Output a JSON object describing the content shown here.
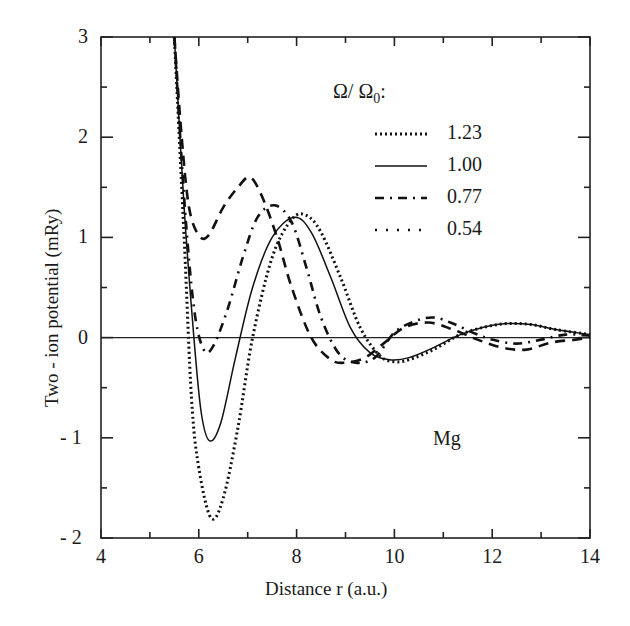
{
  "chart_data": {
    "type": "line",
    "title": "",
    "xlabel": "Distance r (a.u.)",
    "ylabel": "Two - ion potential (mRy)",
    "xlim": [
      4,
      14
    ],
    "ylim": [
      -2,
      3
    ],
    "xticks": [
      "4",
      "6",
      "8",
      "10",
      "12",
      "14"
    ],
    "yticks": [
      "- 2",
      "- 1",
      "0",
      "1",
      "2",
      "3"
    ],
    "grid": false,
    "legend_title": "Ω/ Ω0:",
    "legend_position": "upper right",
    "annotation": "Mg",
    "series": [
      {
        "name": "1.23",
        "style": "dotted-dense",
        "x": [
          5.5,
          5.7,
          5.85,
          6.0,
          6.25,
          6.5,
          6.8,
          7.1,
          7.5,
          7.9,
          8.2,
          8.5,
          8.9,
          9.3,
          9.7,
          10.0,
          10.3,
          10.8,
          11.3,
          11.8,
          12.3,
          12.8,
          13.3,
          14.0
        ],
        "y": [
          3.0,
          1.0,
          -0.6,
          -1.3,
          -1.8,
          -1.6,
          -0.9,
          0.0,
          0.8,
          1.18,
          1.22,
          1.05,
          0.6,
          0.1,
          -0.18,
          -0.24,
          -0.22,
          -0.12,
          0.02,
          0.1,
          0.14,
          0.13,
          0.08,
          0.03
        ]
      },
      {
        "name": "1.00",
        "style": "solid",
        "x": [
          5.5,
          5.7,
          5.9,
          6.05,
          6.22,
          6.45,
          6.75,
          7.1,
          7.5,
          7.95,
          8.3,
          8.7,
          9.1,
          9.5,
          9.9,
          10.3,
          10.8,
          11.3,
          11.8,
          12.3,
          12.8,
          13.3,
          14.0
        ],
        "y": [
          3.0,
          1.3,
          0.0,
          -0.75,
          -1.03,
          -0.85,
          -0.2,
          0.5,
          1.0,
          1.2,
          1.05,
          0.6,
          0.1,
          -0.15,
          -0.22,
          -0.2,
          -0.1,
          0.02,
          0.1,
          0.14,
          0.13,
          0.08,
          0.03
        ]
      },
      {
        "name": "0.77",
        "style": "dash-dot",
        "x": [
          5.5,
          5.7,
          5.9,
          6.1,
          6.3,
          6.6,
          6.9,
          7.2,
          7.55,
          7.9,
          8.2,
          8.5,
          8.85,
          9.2,
          9.6,
          10.0,
          10.4,
          10.8,
          11.2,
          11.6,
          12.0,
          12.5,
          13.0,
          13.5,
          14.0
        ],
        "y": [
          3.0,
          1.4,
          0.3,
          -0.12,
          -0.08,
          0.3,
          0.8,
          1.2,
          1.32,
          1.15,
          0.7,
          0.2,
          -0.15,
          -0.25,
          -0.2,
          0.05,
          0.16,
          0.2,
          0.14,
          0.05,
          -0.02,
          -0.06,
          -0.02,
          0.03,
          0.02
        ]
      },
      {
        "name": "0.54",
        "style": "dashed",
        "x": [
          5.5,
          5.65,
          5.8,
          6.0,
          6.2,
          6.5,
          6.8,
          7.05,
          7.3,
          7.6,
          7.9,
          8.3,
          8.7,
          9.0,
          9.4,
          9.8,
          10.2,
          10.7,
          11.2,
          11.7,
          12.2,
          12.7,
          13.2,
          13.7,
          14.0
        ],
        "y": [
          3.0,
          2.0,
          1.3,
          1.02,
          1.02,
          1.3,
          1.5,
          1.6,
          1.4,
          1.0,
          0.5,
          0.0,
          -0.22,
          -0.25,
          -0.2,
          -0.05,
          0.1,
          0.15,
          0.08,
          -0.02,
          -0.1,
          -0.12,
          -0.05,
          -0.02,
          0.0
        ]
      }
    ]
  }
}
